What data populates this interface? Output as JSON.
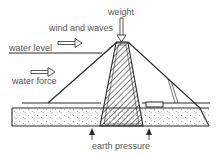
{
  "diagram": {
    "type": "embankment-dam-cross-section",
    "labels": {
      "weight": "weight",
      "wind_and_waves": "wind and waves",
      "water_level": "water level",
      "water_force": "water force",
      "earth_pressure": "earth pressure"
    },
    "colors": {
      "line": "#2a2a2a",
      "text": "#555555",
      "background": "#ffffff"
    },
    "forces": [
      {
        "name": "weight",
        "direction": "down"
      },
      {
        "name": "wind and waves",
        "direction": "right"
      },
      {
        "name": "water force",
        "direction": "right"
      },
      {
        "name": "earth pressure",
        "direction": "up"
      }
    ]
  }
}
